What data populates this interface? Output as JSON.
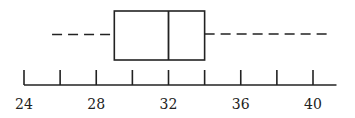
{
  "chart_data": {
    "type": "boxplot",
    "title": "",
    "xlabel": "",
    "ylabel": "",
    "orientation": "horizontal",
    "xlim": [
      24,
      41
    ],
    "ticks": [
      24,
      26,
      28,
      30,
      32,
      34,
      36,
      38,
      40
    ],
    "tick_labels": [
      "24",
      "28",
      "32",
      "36",
      "40"
    ],
    "grid": false,
    "min": 25,
    "q1": 29,
    "median": 32,
    "q3": 34,
    "max": 41,
    "whisker_style": "dashed"
  },
  "colors": {
    "line": "#222222",
    "background": "#ffffff"
  }
}
